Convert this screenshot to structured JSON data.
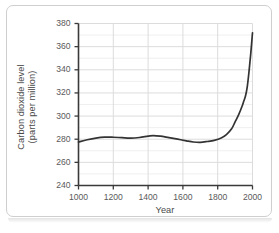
{
  "figure": {
    "border_color": "#cfcfcf",
    "background": "#ffffff"
  },
  "chart_data": {
    "type": "line",
    "title": "",
    "xlabel": "Year",
    "ylabel": "Carbon dioxide level (parts per million)",
    "ylabel_lines": [
      "Carbon dioxide level",
      "(parts per million)"
    ],
    "xlim": [
      1000,
      2000
    ],
    "ylim": [
      240,
      380
    ],
    "xticks": [
      1000,
      1200,
      1400,
      1600,
      1800,
      2000
    ],
    "xtick_labels": [
      "1000",
      "1200",
      "1400",
      "1600",
      "1800",
      "2000"
    ],
    "yticks": [
      240,
      260,
      280,
      300,
      320,
      340,
      360,
      380
    ],
    "ytick_labels": [
      "240",
      "260",
      "280",
      "300",
      "320",
      "340",
      "360",
      "380"
    ],
    "grid": {
      "major_y": true,
      "minor_y_step": 10,
      "major_x": true,
      "major_color": "#dcdcdc",
      "minor_color": "#efefef"
    },
    "legend": "none",
    "series": [
      {
        "name": "Carbon dioxide level",
        "color": "#333333",
        "line_width": 1.7,
        "x": [
          1000,
          1050,
          1100,
          1150,
          1200,
          1250,
          1300,
          1350,
          1400,
          1430,
          1470,
          1520,
          1570,
          1620,
          1660,
          1700,
          1740,
          1780,
          1820,
          1850,
          1880,
          1900,
          1920,
          1940,
          1950,
          1960,
          1970,
          1980,
          1990,
          2000
        ],
        "y": [
          277.5,
          279.5,
          281.0,
          281.8,
          281.7,
          281.3,
          281.0,
          281.5,
          282.6,
          283.1,
          282.6,
          281.3,
          280.0,
          278.6,
          277.6,
          277.3,
          278.0,
          279.0,
          281.0,
          284.0,
          289.0,
          295.0,
          301.0,
          308.5,
          313.0,
          317.5,
          325.5,
          338.5,
          354.0,
          372.0
        ]
      }
    ],
    "annotations": []
  }
}
